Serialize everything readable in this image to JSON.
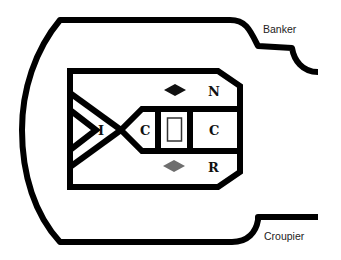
{
  "diagram": {
    "labels": {
      "banker": "Banker",
      "croupier": "Croupier",
      "n": "N",
      "r": "R",
      "c_left": "C",
      "c_right": "C",
      "i": "I"
    },
    "markers": {
      "top_diamond": {
        "color": "#111111"
      },
      "bottom_diamond": {
        "color": "#6e6e6e"
      }
    },
    "colors": {
      "stroke": "#000000",
      "background": "#ffffff",
      "center_box": "#333333"
    }
  }
}
